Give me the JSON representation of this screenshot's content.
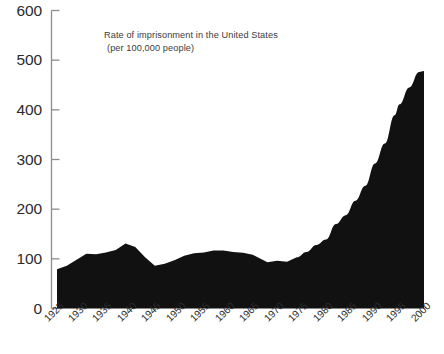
{
  "chart_data": {
    "type": "area",
    "title": "Rate of imprisonment in the United States",
    "subtitle": "(per 100,000 people)",
    "xlabel": "",
    "ylabel": "",
    "xlim": [
      1925,
      2000
    ],
    "ylim": [
      0,
      600
    ],
    "grid": false,
    "legend": null,
    "fill_color": "#111111",
    "axis_color": "#8c8c8c",
    "text_color": "#2b2b2b",
    "background_color": "#ffffff",
    "ytick_labels": [
      "600",
      "500",
      "400",
      "300",
      "200",
      "100",
      "0"
    ],
    "ytick_values": [
      600,
      500,
      400,
      300,
      200,
      100,
      0
    ],
    "xtick_labels": [
      "1925",
      "1930",
      "1935",
      "1940",
      "1945",
      "1950",
      "1955",
      "1960",
      "1965",
      "1970",
      "1975",
      "1980",
      "1985",
      "1990",
      "1995",
      "2000"
    ],
    "xtick_values": [
      1925,
      1930,
      1935,
      1940,
      1945,
      1950,
      1955,
      1960,
      1965,
      1970,
      1975,
      1980,
      1985,
      1990,
      1995,
      2000
    ],
    "x": [
      1925,
      1927,
      1929,
      1931,
      1933,
      1935,
      1937,
      1939,
      1941,
      1943,
      1945,
      1947,
      1949,
      1951,
      1953,
      1955,
      1957,
      1959,
      1961,
      1963,
      1965,
      1967,
      1968,
      1970,
      1972,
      1974,
      1976,
      1978,
      1980,
      1982,
      1984,
      1986,
      1988,
      1990,
      1992,
      1994,
      1995,
      1997,
      1999,
      2000
    ],
    "values": [
      79,
      86,
      98,
      110,
      109,
      113,
      118,
      131,
      124,
      103,
      86,
      90,
      97,
      106,
      111,
      113,
      117,
      117,
      114,
      112,
      108,
      98,
      93,
      96,
      94,
      103,
      114,
      128,
      139,
      170,
      188,
      217,
      247,
      292,
      332,
      389,
      411,
      445,
      476,
      478
    ],
    "series_points": [
      {
        "year": 1925,
        "value": 79
      },
      {
        "year": 1930,
        "value": 104
      },
      {
        "year": 1935,
        "value": 113
      },
      {
        "year": 1939,
        "value": 131
      },
      {
        "year": 1940,
        "value": 129
      },
      {
        "year": 1945,
        "value": 86
      },
      {
        "year": 1950,
        "value": 100
      },
      {
        "year": 1955,
        "value": 113
      },
      {
        "year": 1957,
        "value": 117
      },
      {
        "year": 1960,
        "value": 117
      },
      {
        "year": 1965,
        "value": 108
      },
      {
        "year": 1968,
        "value": 93
      },
      {
        "year": 1970,
        "value": 96
      },
      {
        "year": 1975,
        "value": 111
      },
      {
        "year": 1980,
        "value": 139
      },
      {
        "year": 1985,
        "value": 202
      },
      {
        "year": 1990,
        "value": 292
      },
      {
        "year": 1995,
        "value": 411
      },
      {
        "year": 2000,
        "value": 478
      }
    ]
  }
}
